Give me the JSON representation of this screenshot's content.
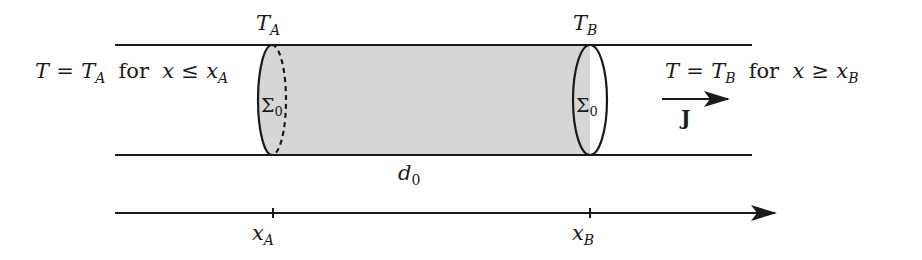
{
  "colors": {
    "stroke": "#1a1a1a",
    "shaded_region": "#d6d6d6",
    "background": "#ffffff"
  },
  "labels": {
    "top_left_temp": {
      "main": "T",
      "sub": "A"
    },
    "top_right_temp": {
      "main": "T",
      "sub": "B"
    },
    "left_condition": {
      "lhs": "T",
      "eq": "=",
      "rhs_main": "T",
      "rhs_sub": "A",
      "word": "for",
      "var": "x",
      "rel": "≤",
      "bound_main": "x",
      "bound_sub": "A"
    },
    "right_condition": {
      "lhs": "T",
      "eq": "=",
      "rhs_main": "T",
      "rhs_sub": "B",
      "word": "for",
      "var": "x",
      "rel": "≥",
      "bound_main": "x",
      "bound_sub": "B"
    },
    "left_section": {
      "main": "Σ",
      "sub": "0"
    },
    "right_section": {
      "main": "Σ",
      "sub": "0"
    },
    "length": {
      "main": "d",
      "sub": "0"
    },
    "flux": "J",
    "axis_tick_a": {
      "main": "x",
      "sub": "A"
    },
    "axis_tick_b": {
      "main": "x",
      "sub": "B"
    }
  }
}
